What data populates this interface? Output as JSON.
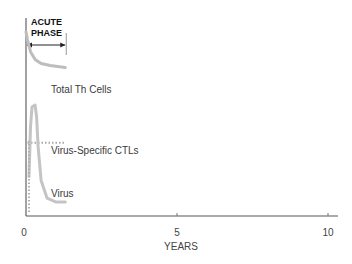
{
  "chart_data": {
    "type": "line",
    "title": "",
    "xlabel": "YEARS",
    "ylabel": "",
    "xlim": [
      0,
      10
    ],
    "ylim": [
      0,
      100
    ],
    "x_ticks": [
      "0",
      "5",
      "10"
    ],
    "grid": false,
    "annotation": {
      "header_line1": "ACUTE",
      "header_line2": "PHASE",
      "range_years": [
        0,
        1.3
      ]
    },
    "series": [
      {
        "name": "Total Th Cells",
        "style": "solid",
        "color": "#bdbdbd",
        "x": [
          0,
          0.05,
          0.15,
          0.3,
          0.5,
          0.8,
          1.3
        ],
        "y": [
          93,
          89,
          83,
          79,
          77,
          76,
          75
        ]
      },
      {
        "name": "Virus-Specific CTLs",
        "style": "dotted",
        "color": "#a8a8a8",
        "x": [
          0.05,
          0.3,
          0.6,
          1.0,
          1.3
        ],
        "y": [
          37,
          37,
          37,
          37,
          37
        ]
      },
      {
        "name": "Virus",
        "style": "solid",
        "color": "#c4c4c4",
        "x": [
          0.1,
          0.15,
          0.2,
          0.3,
          0.35,
          0.4,
          0.5,
          0.7,
          1.0,
          1.3
        ],
        "y": [
          20,
          45,
          55,
          56,
          50,
          35,
          18,
          9,
          7,
          7
        ]
      },
      {
        "name": "Virus (early dotted)",
        "style": "dotted",
        "color": "#b0b0b0",
        "x": [
          0.1,
          0.1
        ],
        "y": [
          2,
          38
        ]
      }
    ],
    "legend": "inline-labels"
  },
  "labels": {
    "total_th": "Total Th Cells",
    "ctls": "Virus-Specific CTLs",
    "virus": "Virus"
  }
}
